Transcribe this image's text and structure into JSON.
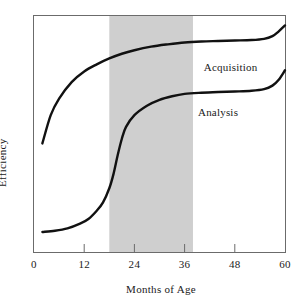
{
  "chart_data": {
    "type": "line",
    "title": "",
    "xlabel": "Months of Age",
    "ylabel": "Efficiency",
    "xlim": [
      0,
      60
    ],
    "ylim": [
      0,
      100
    ],
    "grid": false,
    "legend_position": "inline-right",
    "xticks": [
      {
        "value": 0,
        "label": "0"
      },
      {
        "value": 12,
        "label": "12"
      },
      {
        "value": 24,
        "label": "24"
      },
      {
        "value": 36,
        "label": "36"
      },
      {
        "value": 48,
        "label": "48"
      },
      {
        "value": 60,
        "label": "60"
      }
    ],
    "yticks": [],
    "shaded_region": {
      "x_start": 18,
      "x_end": 38,
      "color": "#cfcfcf",
      "label": ""
    },
    "series": [
      {
        "name": "Acquisition",
        "color": "#111111",
        "label_x": 47,
        "label_y": 78,
        "x": [
          2,
          4,
          6,
          9,
          12,
          15,
          18,
          21,
          24,
          28,
          32,
          36,
          40,
          44,
          48,
          52,
          55,
          57,
          58.5,
          60
        ],
        "values": [
          46,
          58,
          65,
          72,
          76.5,
          79.5,
          82,
          84,
          85.5,
          87,
          88,
          88.8,
          89.2,
          89.4,
          89.6,
          89.8,
          90.3,
          91.5,
          93.5,
          96
        ]
      },
      {
        "name": "Analysis",
        "color": "#111111",
        "label_x": 44,
        "label_y": 59,
        "x": [
          2,
          5,
          8,
          11,
          13,
          15,
          16.5,
          18,
          19,
          20,
          21,
          22,
          24,
          27,
          30,
          33,
          36,
          40,
          44,
          48,
          52,
          55,
          57,
          58.5,
          60
        ],
        "values": [
          8.5,
          9,
          10,
          12,
          14,
          17.5,
          21,
          27,
          33,
          41,
          48,
          53,
          58,
          62,
          64.5,
          66,
          67,
          67.5,
          67.8,
          68,
          68.3,
          69,
          70.5,
          73,
          77
        ]
      }
    ]
  }
}
